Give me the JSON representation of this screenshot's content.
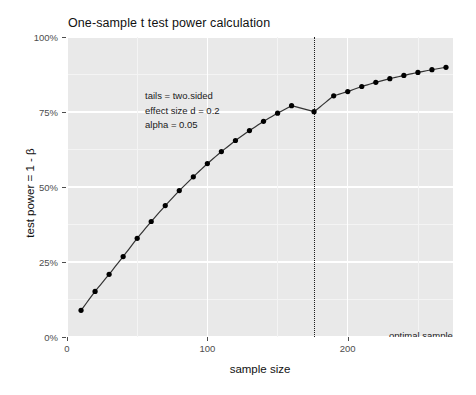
{
  "chart_data": {
    "type": "line",
    "title": "One-sample t test power calculation",
    "xlabel": "sample size",
    "ylabel": "test power = 1 - β",
    "xlim": [
      0,
      275
    ],
    "ylim": [
      0,
      1
    ],
    "grid": true,
    "legend": "none",
    "x_tick_labels": [
      "0",
      "100",
      "200"
    ],
    "x_tick_values": [
      0,
      100,
      200
    ],
    "y_tick_labels": [
      "0%",
      "25%",
      "50%",
      "75%",
      "100%"
    ],
    "y_tick_values": [
      0,
      0.25,
      0.5,
      0.75,
      1.0
    ],
    "marker": "filled-circle",
    "line_color": "#333333",
    "point_color": "#000000",
    "panel_color": "#e9e9e9",
    "grid_color": "#ffffff",
    "x": [
      10,
      20,
      30,
      40,
      50,
      60,
      70,
      80,
      90,
      100,
      110,
      120,
      130,
      140,
      150,
      160,
      176,
      190,
      200,
      210,
      220,
      230,
      240,
      250,
      260,
      270
    ],
    "values": [
      0.089,
      0.152,
      0.209,
      0.268,
      0.329,
      0.385,
      0.438,
      0.488,
      0.534,
      0.5,
      0.578,
      0.618,
      0.655,
      0.688,
      0.719,
      0.746,
      0.751,
      0.804,
      0.818,
      0.835,
      0.849,
      0.861,
      0.872,
      0.882,
      0.891,
      0.899
    ],
    "series": [
      {
        "name": "power",
        "points": [
          {
            "n": 10,
            "power": 0.089
          },
          {
            "n": 20,
            "power": 0.152
          },
          {
            "n": 30,
            "power": 0.209
          },
          {
            "n": 40,
            "power": 0.268
          },
          {
            "n": 50,
            "power": 0.329
          },
          {
            "n": 60,
            "power": 0.385
          },
          {
            "n": 70,
            "power": 0.438
          },
          {
            "n": 80,
            "power": 0.488
          },
          {
            "n": 90,
            "power": 0.534
          },
          {
            "n": 100,
            "power": 0.578
          },
          {
            "n": 110,
            "power": 0.618
          },
          {
            "n": 120,
            "power": 0.655
          },
          {
            "n": 130,
            "power": 0.688
          },
          {
            "n": 140,
            "power": 0.719
          },
          {
            "n": 150,
            "power": 0.746
          },
          {
            "n": 160,
            "power": 0.771
          },
          {
            "n": 176,
            "power": 0.751
          },
          {
            "n": 190,
            "power": 0.804
          },
          {
            "n": 200,
            "power": 0.818
          },
          {
            "n": 210,
            "power": 0.835
          },
          {
            "n": 220,
            "power": 0.849
          },
          {
            "n": 230,
            "power": 0.861
          },
          {
            "n": 240,
            "power": 0.872
          },
          {
            "n": 250,
            "power": 0.882
          },
          {
            "n": 260,
            "power": 0.891
          },
          {
            "n": 270,
            "power": 0.899
          }
        ]
      }
    ],
    "annotations": {
      "params": {
        "tails": "tails = two.sided",
        "effect_size": "effect size d = 0.2",
        "alpha": "alpha = 0.05"
      },
      "optimal": {
        "caption": "optimal sample size",
        "value": "n = 176",
        "vline_x": 176
      }
    }
  }
}
